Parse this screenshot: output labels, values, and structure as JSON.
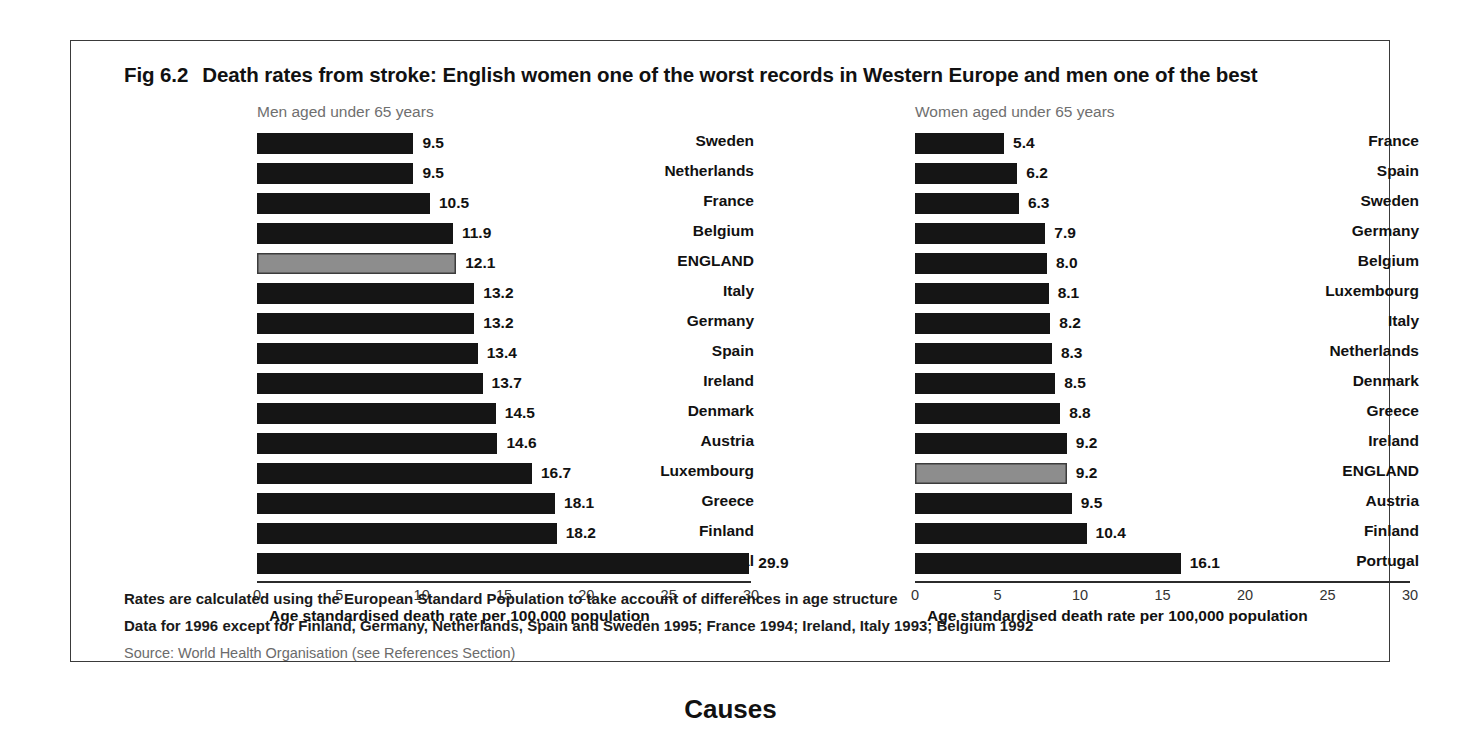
{
  "figure": {
    "number": "Fig 6.2",
    "title": "Death rates from stroke:  English women one of the worst records in Western Europe and men one of the best"
  },
  "footnotes": {
    "line1": "Rates are calculated using the European Standard Population to take account of differences in age structure",
    "line2": "Data for 1996 except for Finland, Germany, Netherlands, Spain and Sweden 1995; France 1994; Ireland, Italy 1993; Belgium 1992",
    "source": "Source: World Health Organisation (see References Section)"
  },
  "section_heading": "Causes",
  "highlight_color": "#8d8d8d",
  "bar_color": "#151515",
  "chart_data": [
    {
      "type": "bar",
      "orientation": "horizontal",
      "id": "men",
      "title": "Men aged under 65 years",
      "xlabel": "Age standardised death rate per 100,000 population",
      "ylabel": "",
      "xlim": [
        0,
        30
      ],
      "xticks": [
        0,
        5,
        10,
        15,
        20,
        25,
        30
      ],
      "xticklabels": [
        "0",
        "5",
        "10",
        "15",
        "20",
        "25",
        "30"
      ],
      "grid": false,
      "legend": false,
      "highlight_category": "ENGLAND",
      "categories": [
        "Sweden",
        "Netherlands",
        "France",
        "Belgium",
        "ENGLAND",
        "Italy",
        "Germany",
        "Spain",
        "Ireland",
        "Denmark",
        "Austria",
        "Luxembourg",
        "Greece",
        "Finland",
        "Portugal"
      ],
      "values": [
        9.5,
        9.5,
        10.5,
        11.9,
        12.1,
        13.2,
        13.2,
        13.4,
        13.7,
        14.5,
        14.6,
        16.7,
        18.1,
        18.2,
        29.9
      ],
      "value_labels": [
        "9.5",
        "9.5",
        "10.5",
        "11.9",
        "12.1",
        "13.2",
        "13.2",
        "13.4",
        "13.7",
        "14.5",
        "14.6",
        "16.7",
        "18.1",
        "18.2",
        "29.9"
      ]
    },
    {
      "type": "bar",
      "orientation": "horizontal",
      "id": "women",
      "title": "Women aged under 65 years",
      "xlabel": "Age standardised death rate per 100,000 population",
      "ylabel": "",
      "xlim": [
        0,
        30
      ],
      "xticks": [
        0,
        5,
        10,
        15,
        20,
        25,
        30
      ],
      "xticklabels": [
        "0",
        "5",
        "10",
        "15",
        "20",
        "25",
        "30"
      ],
      "grid": false,
      "legend": false,
      "highlight_category": "ENGLAND",
      "categories": [
        "France",
        "Spain",
        "Sweden",
        "Germany",
        "Belgium",
        "Luxembourg",
        "Italy",
        "Netherlands",
        "Denmark",
        "Greece",
        "Ireland",
        "ENGLAND",
        "Austria",
        "Finland",
        "Portugal"
      ],
      "values": [
        5.4,
        6.2,
        6.3,
        7.9,
        8.0,
        8.1,
        8.2,
        8.3,
        8.5,
        8.8,
        9.2,
        9.2,
        9.5,
        10.4,
        16.1
      ],
      "value_labels": [
        "5.4",
        "6.2",
        "6.3",
        "7.9",
        "8.0",
        "8.1",
        "8.2",
        "8.3",
        "8.5",
        "8.8",
        "9.2",
        "9.2",
        "9.5",
        "10.4",
        "16.1"
      ]
    }
  ]
}
